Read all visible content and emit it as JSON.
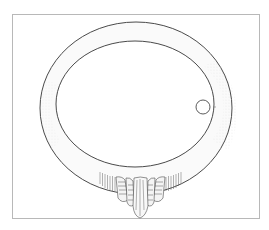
{
  "figure": {
    "frame": {
      "x": 12,
      "y": 14,
      "width": 248,
      "height": 205,
      "color": "#b8b8b8"
    },
    "ring": {
      "outer": {
        "cx": 136,
        "cy": 108,
        "rx": 96,
        "ry": 86
      },
      "inner": {
        "cx": 135,
        "cy": 104,
        "rx": 79,
        "ry": 63
      },
      "stroke_color": "#4a4a4a",
      "shade_color": "#d8d8d8"
    },
    "hole": {
      "cx": 203,
      "cy": 107,
      "r": 7
    },
    "ornament": {
      "cx": 140,
      "top": 170,
      "bottom": 218
    }
  }
}
